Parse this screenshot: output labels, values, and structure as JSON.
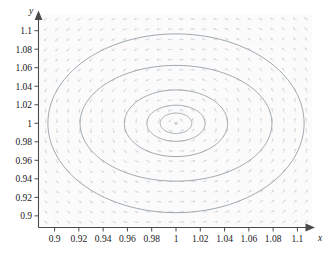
{
  "figure": {
    "kind": "phase-portrait",
    "background_color": "#ffffff",
    "plot_background_color": "#fbfbfb",
    "axis_color": "#4a4a4a",
    "orbit_color": "#9aa3ab",
    "field_color": "#d8dcdf",
    "label_color": "#1a1a1a"
  },
  "axes": {
    "x": {
      "name": "x",
      "arrow": "arrow-right",
      "min": 0.888,
      "max": 1.112,
      "ticks": [
        "0.9",
        "0.92",
        "0.94",
        "0.96",
        "0.98",
        "1",
        "1.02",
        "1.04",
        "1.06",
        "1.08",
        "1.1"
      ],
      "tick_values": [
        0.9,
        0.92,
        0.94,
        0.96,
        0.98,
        1.0,
        1.02,
        1.04,
        1.06,
        1.08,
        1.1
      ]
    },
    "y": {
      "name": "y",
      "arrow": "arrow-up",
      "min": 0.888,
      "max": 1.118,
      "ticks": [
        "0.9",
        "0.92",
        "0.94",
        "0.96",
        "0.98",
        "1",
        "1.02",
        "1.04",
        "1.06",
        "1.08",
        "1.1"
      ],
      "tick_values": [
        0.9,
        0.92,
        0.94,
        0.96,
        0.98,
        1.0,
        1.02,
        1.04,
        1.06,
        1.08,
        1.1
      ]
    }
  },
  "chart_data": {
    "type": "line",
    "title": "",
    "subtitle": "",
    "xlabel": "x",
    "ylabel": "y",
    "xlim": [
      0.888,
      1.112
    ],
    "ylim": [
      0.888,
      1.118
    ],
    "grid": false,
    "legend": "none",
    "annotations": [],
    "center": {
      "x": 1.0,
      "y": 1.0,
      "label": "equilibrium-point"
    },
    "series": [
      {
        "name": "orbit-1-innermost",
        "type": "closed-orbit-ellipse",
        "cx": 1.0,
        "cy": 1.0,
        "rx": 0.013,
        "ry": 0.011,
        "values": []
      },
      {
        "name": "orbit-2",
        "type": "closed-orbit-ellipse",
        "cx": 1.0,
        "cy": 1.0,
        "rx": 0.024,
        "ry": 0.0195,
        "values": []
      },
      {
        "name": "orbit-3",
        "type": "closed-orbit-ellipse",
        "cx": 1.0,
        "cy": 1.0,
        "rx": 0.0425,
        "ry": 0.036,
        "values": []
      },
      {
        "name": "orbit-4",
        "type": "closed-orbit-ellipse",
        "cx": 1.0,
        "cy": 1.0,
        "rx": 0.079,
        "ry": 0.0625,
        "values": []
      },
      {
        "name": "orbit-5-outermost",
        "type": "closed-orbit-ellipse",
        "cx": 1.0,
        "cy": 1.0,
        "rx": 0.1055,
        "ry": 0.0965,
        "values": []
      }
    ],
    "vector_field": {
      "name": "direction-field",
      "description": "counter-clockwise arrows tangent to closed orbits about (1,1)",
      "rotation": "counter-clockwise",
      "grid_columns": 24,
      "grid_rows": 21,
      "arrow_color": "#d8dcdf"
    }
  }
}
